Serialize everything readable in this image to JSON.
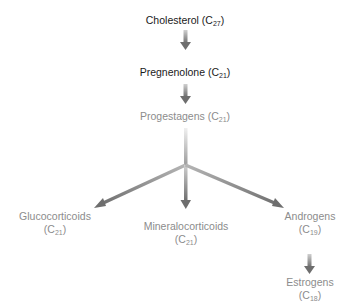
{
  "diagram": {
    "nodes": [
      {
        "id": "cholesterol",
        "name": "Cholesterol",
        "carbon": "27",
        "shade": "dark"
      },
      {
        "id": "pregnenolone",
        "name": "Pregnenolone",
        "carbon": "21",
        "shade": "dark"
      },
      {
        "id": "progestagens",
        "name": "Progestagens",
        "carbon": "21",
        "shade": "light"
      },
      {
        "id": "glucocorticoids",
        "name": "Glucocorticoids",
        "carbon": "21",
        "shade": "light"
      },
      {
        "id": "mineralocorticoids",
        "name": "Mineralocorticoids",
        "carbon": "21",
        "shade": "light"
      },
      {
        "id": "androgens",
        "name": "Androgens",
        "carbon": "19",
        "shade": "light"
      },
      {
        "id": "estrogens",
        "name": "Estrogens",
        "carbon": "18",
        "shade": "light"
      }
    ],
    "edges": [
      {
        "from": "cholesterol",
        "to": "pregnenolone"
      },
      {
        "from": "pregnenolone",
        "to": "progestagens"
      },
      {
        "from": "progestagens",
        "to": "glucocorticoids"
      },
      {
        "from": "progestagens",
        "to": "mineralocorticoids"
      },
      {
        "from": "progestagens",
        "to": "androgens"
      },
      {
        "from": "androgens",
        "to": "estrogens"
      }
    ],
    "colors": {
      "dark_text": "#1a1a1a",
      "light_text": "#8c8c8c",
      "arrow": "#6e6e6e"
    }
  }
}
